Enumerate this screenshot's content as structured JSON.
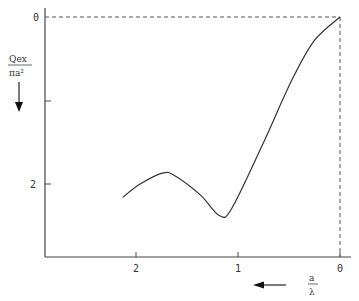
{
  "chart_data": {
    "type": "line",
    "title": "",
    "xlabel": "a/λ",
    "ylabel": "Qex/πa²",
    "x_direction_arrow": "left",
    "y_direction_arrow": "down",
    "xlim": [
      0,
      2.9
    ],
    "ylim": [
      0,
      2.9
    ],
    "x_inverted": true,
    "y_inverted": true,
    "grid": false,
    "x_ticks": [
      "2",
      "1",
      "0"
    ],
    "y_ticks": [
      "0",
      "",
      "2"
    ],
    "reference_lines": [
      "dashed horizontal at y=0",
      "dashed vertical at x=0"
    ],
    "series": [
      {
        "name": "Qex/πa²",
        "x": [
          2.13,
          1.96,
          1.74,
          1.62,
          1.37,
          1.18,
          1.06,
          0.76,
          0.47,
          0.25,
          0.0
        ],
        "y": [
          2.16,
          2.0,
          1.87,
          1.9,
          2.13,
          2.38,
          2.29,
          1.53,
          0.75,
          0.28,
          0.0
        ]
      }
    ]
  },
  "labels": {
    "y0": "0",
    "y2": "2",
    "x2": "2",
    "x1": "1",
    "x0": "0",
    "ylabel_num": "Qex",
    "ylabel_den": "πa²",
    "xlabel_num": "a",
    "xlabel_den": "λ"
  }
}
